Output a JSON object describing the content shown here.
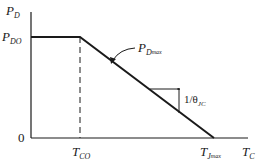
{
  "diagram": {
    "y_axis_label": {
      "main": "P",
      "sub": "D"
    },
    "x_axis_label": {
      "main": "T",
      "sub": "C"
    },
    "y_tick_pdo": {
      "main": "P",
      "sub": "DO"
    },
    "y_tick_zero": "0",
    "x_tick_tco": {
      "main": "T",
      "sub": "CO"
    },
    "x_tick_tjmax": {
      "main": "T",
      "sub": "J",
      "subsub": "max"
    },
    "curve_label": {
      "main": "P",
      "sub": "D",
      "subsub": "max"
    },
    "slope_label": {
      "prefix": "1/θ",
      "sub": "JC"
    },
    "colors": {
      "line": "#1a1a1a",
      "background": "#ffffff"
    }
  }
}
